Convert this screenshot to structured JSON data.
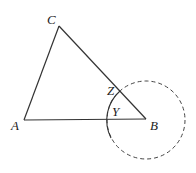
{
  "diagram": {
    "labels": {
      "A": "A",
      "B": "B",
      "C": "C",
      "Y": "Y",
      "Z": "Z"
    },
    "colors": {
      "stroke": "#333333",
      "background": "#ffffff"
    }
  }
}
